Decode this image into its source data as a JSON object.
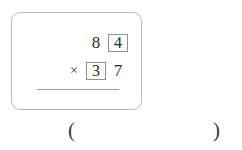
{
  "problem": {
    "type": "column-multiplication",
    "operator": "×",
    "top_operand": {
      "digits": [
        {
          "value": "8",
          "boxed": false
        },
        {
          "value": "4",
          "boxed": true
        }
      ]
    },
    "bottom_operand": {
      "digits": [
        {
          "value": "3",
          "boxed": true
        },
        {
          "value": "7",
          "boxed": false
        }
      ]
    },
    "rule_visible": true
  },
  "answer": {
    "paren_open": "(",
    "paren_close": ")",
    "value": "",
    "placeholder": ""
  },
  "colors": {
    "text": "#2b2b2b",
    "panel_border": "#b9b9bb",
    "box_border": "#8f8f93",
    "rule": "#9d9da1",
    "background": "#ffffff"
  }
}
